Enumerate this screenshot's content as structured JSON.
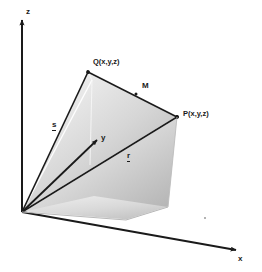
{
  "figure": {
    "background_color": "#ffffff",
    "line_color": "#1a1a1a",
    "face_light": "#f2f2f2",
    "face_mid": "#cfcfcf",
    "face_dark": "#a8a8a8"
  },
  "axes": {
    "z": {
      "label": "z",
      "label_x": 26,
      "label_y": 8
    },
    "y": {
      "label": "y",
      "label_x": 101,
      "label_y": 136
    },
    "x": {
      "label": "x",
      "label_x": 238,
      "label_y": 258
    },
    "origin": {
      "x": 22,
      "y": 212
    }
  },
  "points": {
    "Q": {
      "label": "Q(x,y,z)",
      "label_x": 93,
      "label_y": 61,
      "vertex_x": 88,
      "vertex_y": 72
    },
    "P": {
      "label": "P(x,y,z)",
      "label_x": 183,
      "label_y": 112,
      "vertex_x": 177,
      "vertex_y": 117
    },
    "M_marker": {
      "x": 136,
      "y": 94
    }
  },
  "vectors": {
    "s": {
      "label": "s",
      "label_x": 52,
      "label_y": 124,
      "underlined": true,
      "description": "position vector to Q"
    },
    "r": {
      "label": "r",
      "label_x": 127,
      "label_y": 155,
      "underlined": true,
      "description": "position vector to P"
    },
    "M": {
      "label": "M",
      "label_x": 142,
      "label_y": 85,
      "underlined": false,
      "description": "displacement from Q to P"
    }
  },
  "artifacts": {
    "speck": {
      "x": 204,
      "y": 217
    }
  }
}
